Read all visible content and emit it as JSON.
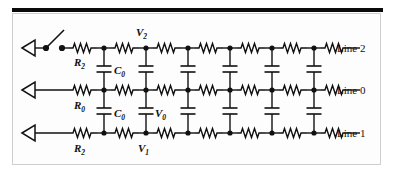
{
  "figure": {
    "type": "circuit-diagram",
    "background": "#ffffff",
    "panel_background": "#fdfdfd",
    "panel_border_color": "#cfcfcf",
    "top_bar_color": "#0a0a0a",
    "ink_color": "#111111"
  },
  "lines": [
    {
      "id": "line2",
      "label": "Line 2",
      "y": 48,
      "series_resistor_label": "R2",
      "node_voltage_label": "V2",
      "has_switch": true
    },
    {
      "id": "line0",
      "label": "Line 0",
      "y": 90,
      "series_resistor_label": "R0",
      "node_voltage_label": "V0",
      "has_switch": false
    },
    {
      "id": "line1",
      "label": "Line 1",
      "y": 133,
      "series_resistor_label": "R2",
      "node_voltage_label": "V1",
      "has_switch": false
    }
  ],
  "labels": {
    "v2": "V",
    "v2_sub": "2",
    "v0": "V",
    "v0_sub": "0",
    "v1": "V",
    "v1_sub": "1",
    "r2_top": "R",
    "r2_top_sub": "2",
    "r0_mid": "R",
    "r0_mid_sub": "0",
    "r2_bot": "R",
    "r2_bot_sub": "2",
    "c0_upper": "C",
    "c0_upper_sub": "0",
    "c0_lower": "C",
    "c0_lower_sub": "0",
    "line2": "Line 2",
    "line0": "Line 0",
    "line1": "Line 1"
  },
  "topology": {
    "stages": 7,
    "node_x": [
      104,
      146,
      188,
      230,
      272,
      314
    ],
    "resistor_centers_x": [
      83,
      125,
      167,
      209,
      251,
      293,
      335
    ],
    "terminal_arrow_x": 30,
    "switch_dot_left_x": 46,
    "switch_dot_right_x": 62,
    "coupling_capacitors_per_gap": 6,
    "capacitor_gaps": [
      "line2-line0",
      "line0-line1"
    ]
  },
  "legend_note": "Each series element is a resistor; each vertical element between adjacent lines is a coupling capacitor C0."
}
